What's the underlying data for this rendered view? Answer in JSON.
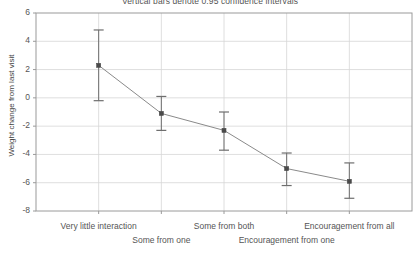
{
  "chart_data": {
    "type": "line",
    "title": "Vertical bars denote 0.95 confidence intervals",
    "xlabel": "",
    "ylabel": "Weight change from last visit",
    "categories": [
      "Very little interaction",
      "Some from one",
      "Some from both",
      "Encouragement from one",
      "Encouragement from all"
    ],
    "values": [
      2.3,
      -1.1,
      -2.3,
      -5.0,
      -5.9
    ],
    "error_low": [
      -0.2,
      -2.3,
      -3.7,
      -6.2,
      -7.1
    ],
    "error_high": [
      4.8,
      0.1,
      -1.0,
      -3.9,
      -4.6
    ],
    "ylim": [
      -8,
      6
    ],
    "yticks": [
      6,
      4,
      2,
      0,
      -2,
      -4,
      -6,
      -8
    ],
    "ytick_labels": [
      "6",
      "4",
      "2",
      "0",
      "-2",
      "-4",
      "-6",
      "-8"
    ],
    "grid": true,
    "legend": "none",
    "marker": "square",
    "line_color": "#8a8a8a",
    "marker_color": "#4a4a4a",
    "error_bar_color": "#6e6e6e",
    "grid_color": "#d6d6d6",
    "axis_color": "#9a9a9a"
  },
  "axis": {
    "y_title": "Weight change from last visit"
  },
  "xlabels": [
    {
      "text": "Very little interaction",
      "row": 0
    },
    {
      "text": "Some from one",
      "row": 1
    },
    {
      "text": "Some from both",
      "row": 0
    },
    {
      "text": "Encouragement from one",
      "row": 1
    },
    {
      "text": "Encouragement from all",
      "row": 0
    }
  ]
}
